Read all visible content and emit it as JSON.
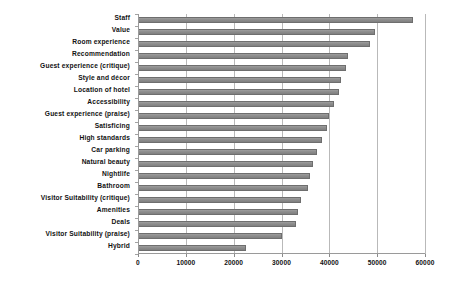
{
  "chart_data": {
    "type": "bar",
    "orientation": "horizontal",
    "title": "",
    "subtitle": "",
    "xlabel": "",
    "ylabel": "",
    "xlim": [
      0,
      60000
    ],
    "ylim": null,
    "grid": true,
    "legend": false,
    "legend_position": "none",
    "xticks": [
      0,
      10000,
      20000,
      30000,
      40000,
      50000,
      60000
    ],
    "xtick_labels": [
      "0",
      "10000",
      "20000",
      "30000",
      "40000",
      "50000",
      "60000"
    ],
    "bar_color": "#8e8e8e",
    "bar_edge_color": "#6e6e6e",
    "gridline_color": "#b9b9b9",
    "axis_color": "#9a9a9a",
    "background_color": "#ffffff",
    "categories": [
      "Staff",
      "Value",
      "Room experience",
      "Recommendation",
      "Guest experience (critique)",
      "Style and décor",
      "Location of hotel",
      "Accessibility",
      "Guest experience (praise)",
      "Satisficing",
      "High standards",
      "Car parking",
      "Natural beauty",
      "Nightlife",
      "Bathroom",
      "Visitor Suitability (critique)",
      "Amenities",
      "Deals",
      "Visitor Suitability (praise)",
      "Hybrid"
    ],
    "values": [
      57500,
      49500,
      48500,
      44000,
      43500,
      42500,
      42000,
      41000,
      40000,
      39500,
      38500,
      37500,
      36500,
      36000,
      35500,
      34000,
      33500,
      33000,
      30000,
      22500
    ]
  }
}
